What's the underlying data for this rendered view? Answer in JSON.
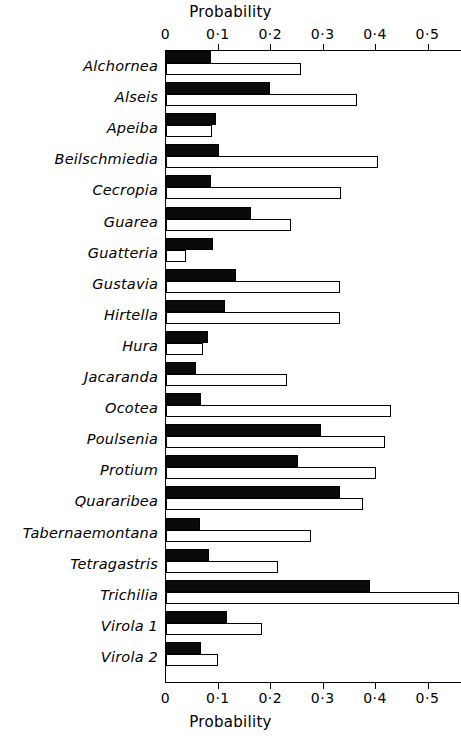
{
  "chart_data": {
    "type": "bar",
    "orientation": "horizontal",
    "title": "",
    "xlabel": "Probability",
    "ylabel": "",
    "xlim": [
      0,
      0.57
    ],
    "grid": false,
    "legend": null,
    "axis_title_top": "Probability",
    "axis_title_bottom": "Probability",
    "tick_values": [
      0,
      0.1,
      0.2,
      0.3,
      0.4,
      0.5
    ],
    "tick_labels": [
      "0",
      "0·1",
      "0·2",
      "0·3",
      "0·4",
      "0·5"
    ],
    "categories": [
      "Alchornea",
      "Alseis",
      "Apeiba",
      "Beilschmiedia",
      "Cecropia",
      "Guarea",
      "Guatteria",
      "Gustavia",
      "Hirtella",
      "Hura",
      "Jacaranda",
      "Ocotea",
      "Poulsenia",
      "Protium",
      "Quararibea",
      "Tabernaemontana",
      "Tetragastris",
      "Trichilia",
      "Virola 1",
      "Virola 2"
    ],
    "series": [
      {
        "name": "filled",
        "style": "black",
        "values": [
          0.086,
          0.198,
          0.095,
          0.102,
          0.086,
          0.162,
          0.09,
          0.133,
          0.112,
          0.08,
          0.058,
          0.066,
          0.295,
          0.251,
          0.332,
          0.065,
          0.082,
          0.39,
          0.117,
          0.067
        ]
      },
      {
        "name": "open",
        "style": "white",
        "values": [
          0.257,
          0.364,
          0.087,
          0.404,
          0.334,
          0.238,
          0.038,
          0.332,
          0.332,
          0.071,
          0.23,
          0.43,
          0.417,
          0.4,
          0.375,
          0.276,
          0.214,
          0.559,
          0.184,
          0.099
        ]
      }
    ]
  },
  "colors": {
    "ink": "#000000",
    "paper": "#ffffff",
    "filled_bar": "#0a0a0a",
    "open_bar": "#ffffff"
  }
}
